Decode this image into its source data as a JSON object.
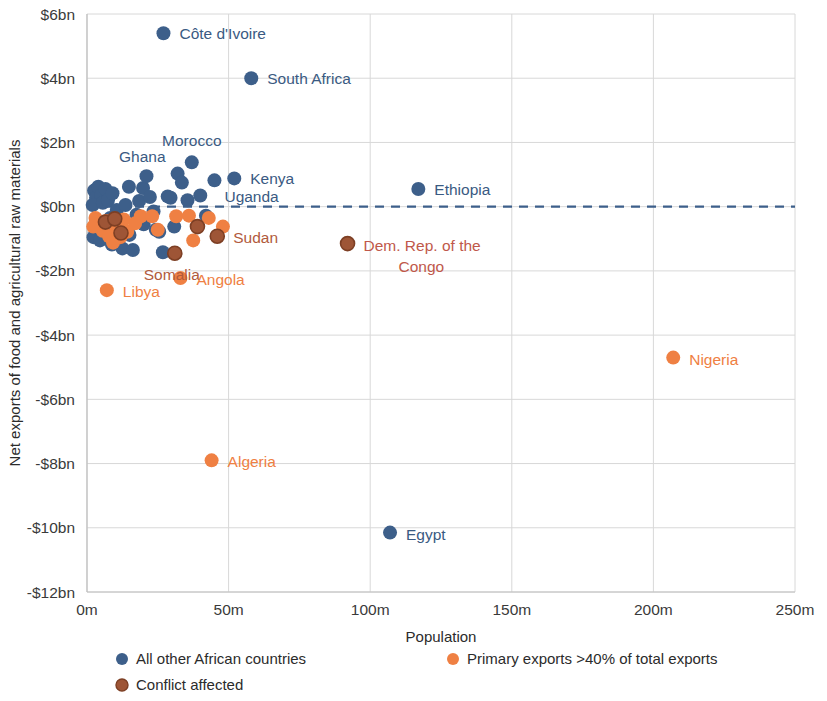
{
  "chart_data": {
    "type": "scatter",
    "title": "",
    "xlabel": "Population",
    "ylabel": "Net exports of food and agricultural raw materials",
    "xlim": [
      0,
      250
    ],
    "ylim": [
      -12,
      6
    ],
    "x_unit": "m",
    "y_unit": "bn",
    "x_ticks": [
      0,
      50,
      100,
      150,
      200,
      250
    ],
    "x_tick_labels": [
      "0m",
      "50m",
      "100m",
      "150m",
      "200m",
      "250m"
    ],
    "y_ticks": [
      6,
      4,
      2,
      0,
      -2,
      -4,
      -6,
      -8,
      -10,
      -12
    ],
    "y_tick_labels": [
      "$6bn",
      "$4bn",
      "$2bn",
      "$0bn",
      "-$2bn",
      "-$4bn",
      "-$6bn",
      "-$8bn",
      "-$10bn",
      "-$12bn"
    ],
    "grid": true,
    "zero_line": {
      "y": 0,
      "style": "dashed",
      "color": "#3d5f8a"
    },
    "legend_position": "bottom",
    "series": [
      {
        "name": "All other African countries",
        "key": "other",
        "color": "#3d5f8a",
        "points": [
          {
            "label": "Côte d'Ivoire",
            "x": 27.0,
            "y": 5.4,
            "label_pos": "right"
          },
          {
            "label": "South Africa",
            "x": 58.0,
            "y": 4.0,
            "label_pos": "right"
          },
          {
            "label": "Morocco",
            "x": 37.0,
            "y": 1.38,
            "label_pos": "above"
          },
          {
            "label": "Ghana",
            "x": 32.0,
            "y": 1.03,
            "label_pos": "above-left"
          },
          {
            "label": "Kenya",
            "x": 52.0,
            "y": 0.88,
            "label_pos": "right"
          },
          {
            "label": "Uganda",
            "x": 45.0,
            "y": 0.82,
            "label_pos": "below-right"
          },
          {
            "label": "Ethiopia",
            "x": 117.0,
            "y": 0.55,
            "label_pos": "right"
          },
          {
            "label": "Egypt",
            "x": 107.0,
            "y": -10.15,
            "label_pos": "right"
          },
          {
            "label": "",
            "x": 2.5,
            "y": 0.5
          },
          {
            "label": "",
            "x": 3.2,
            "y": 0.28
          },
          {
            "label": "",
            "x": 4.0,
            "y": 0.62
          },
          {
            "label": "",
            "x": 5.0,
            "y": 0.34
          },
          {
            "label": "",
            "x": 2.0,
            "y": 0.05
          },
          {
            "label": "",
            "x": 5.6,
            "y": 0.12
          },
          {
            "label": "",
            "x": 6.5,
            "y": 0.55
          },
          {
            "label": "",
            "x": 7.4,
            "y": 0.2
          },
          {
            "label": "",
            "x": 8.2,
            "y": -0.35
          },
          {
            "label": "",
            "x": 3.0,
            "y": -0.6
          },
          {
            "label": "",
            "x": 2.3,
            "y": -0.95
          },
          {
            "label": "",
            "x": 9.0,
            "y": 0.42
          },
          {
            "label": "",
            "x": 10.5,
            "y": -0.1
          },
          {
            "label": "",
            "x": 11.6,
            "y": -0.52
          },
          {
            "label": "",
            "x": 12.5,
            "y": -1.3
          },
          {
            "label": "",
            "x": 13.6,
            "y": 0.05
          },
          {
            "label": "",
            "x": 14.8,
            "y": 0.62
          },
          {
            "label": "",
            "x": 16.2,
            "y": -1.35
          },
          {
            "label": "",
            "x": 17.5,
            "y": -0.25
          },
          {
            "label": "",
            "x": 18.4,
            "y": 0.18
          },
          {
            "label": "",
            "x": 19.8,
            "y": 0.58
          },
          {
            "label": "",
            "x": 21.0,
            "y": 0.95
          },
          {
            "label": "",
            "x": 22.2,
            "y": 0.3
          },
          {
            "label": "",
            "x": 23.5,
            "y": -0.15
          },
          {
            "label": "",
            "x": 24.3,
            "y": -0.72
          },
          {
            "label": "",
            "x": 25.5,
            "y": -0.78
          },
          {
            "label": "",
            "x": 26.8,
            "y": -1.42
          },
          {
            "label": "",
            "x": 28.5,
            "y": 0.32
          },
          {
            "label": "",
            "x": 29.5,
            "y": 0.28
          },
          {
            "label": "",
            "x": 30.8,
            "y": -0.62
          },
          {
            "label": "",
            "x": 33.5,
            "y": 0.75
          },
          {
            "label": "",
            "x": 35.5,
            "y": 0.2
          },
          {
            "label": "",
            "x": 40.0,
            "y": 0.35
          },
          {
            "label": "",
            "x": 42.0,
            "y": -0.28
          },
          {
            "label": "",
            "x": 20.0,
            "y": -0.55
          },
          {
            "label": "",
            "x": 15.0,
            "y": -0.88
          },
          {
            "label": "",
            "x": 6.0,
            "y": -0.7
          },
          {
            "label": "",
            "x": 4.6,
            "y": -1.05
          },
          {
            "label": "",
            "x": 8.8,
            "y": -1.18
          }
        ]
      },
      {
        "name": "Primary exports >40% of total exports",
        "key": "primary",
        "color": "#ef8043",
        "points": [
          {
            "label": "Nigeria",
            "x": 207.0,
            "y": -4.7,
            "label_pos": "right"
          },
          {
            "label": "Algeria",
            "x": 44.0,
            "y": -7.9,
            "label_pos": "right"
          },
          {
            "label": "Angola",
            "x": 33.0,
            "y": -2.22,
            "label_pos": "right"
          },
          {
            "label": "Libya",
            "x": 7.0,
            "y": -2.6,
            "label_pos": "right"
          },
          {
            "label": "",
            "x": 3.0,
            "y": -0.35
          },
          {
            "label": "",
            "x": 4.2,
            "y": -0.55
          },
          {
            "label": "",
            "x": 5.5,
            "y": -0.75
          },
          {
            "label": "",
            "x": 6.8,
            "y": -0.45
          },
          {
            "label": "",
            "x": 7.8,
            "y": -0.92
          },
          {
            "label": "",
            "x": 9.2,
            "y": -1.12
          },
          {
            "label": "",
            "x": 10.4,
            "y": -0.68
          },
          {
            "label": "",
            "x": 11.8,
            "y": -0.95
          },
          {
            "label": "",
            "x": 13.0,
            "y": -0.4
          },
          {
            "label": "",
            "x": 14.2,
            "y": -0.78
          },
          {
            "label": "",
            "x": 2.2,
            "y": -0.62
          },
          {
            "label": "",
            "x": 17.0,
            "y": -0.52
          },
          {
            "label": "",
            "x": 19.0,
            "y": -0.3
          },
          {
            "label": "",
            "x": 23.0,
            "y": -0.3
          },
          {
            "label": "",
            "x": 25.0,
            "y": -0.72
          },
          {
            "label": "",
            "x": 31.5,
            "y": -0.3
          },
          {
            "label": "",
            "x": 36.0,
            "y": -0.28
          },
          {
            "label": "",
            "x": 37.5,
            "y": -1.05
          },
          {
            "label": "",
            "x": 43.0,
            "y": -0.35
          },
          {
            "label": "",
            "x": 48.0,
            "y": -0.62
          }
        ]
      },
      {
        "name": "Conflict affected",
        "key": "conflict",
        "color": "#9e5536",
        "points": [
          {
            "label": "Sudan",
            "x": 46.0,
            "y": -0.92,
            "label_pos": "right"
          },
          {
            "label": "Somalia",
            "x": 31.0,
            "y": -1.45,
            "label_pos": "below-right"
          },
          {
            "label": "Dem. Rep. of the Congo",
            "x": 92.0,
            "y": -1.15,
            "label_pos": "right-two-line"
          },
          {
            "label": "",
            "x": 6.5,
            "y": -0.48
          },
          {
            "label": "",
            "x": 12.0,
            "y": -0.82
          },
          {
            "label": "",
            "x": 39.0,
            "y": -0.62
          },
          {
            "label": "",
            "x": 9.8,
            "y": -0.38
          }
        ]
      }
    ],
    "annotations": [
      {
        "text": "Côte d'Ivoire",
        "x": 27.0,
        "y": 5.4
      },
      {
        "text": "South Africa",
        "x": 58.0,
        "y": 4.0
      },
      {
        "text": "Morocco",
        "x": 37.0,
        "y": 1.38
      },
      {
        "text": "Ghana",
        "x": 32.0,
        "y": 1.03
      },
      {
        "text": "Kenya",
        "x": 52.0,
        "y": 0.88
      },
      {
        "text": "Uganda",
        "x": 45.0,
        "y": 0.82
      },
      {
        "text": "Ethiopia",
        "x": 117.0,
        "y": 0.55
      },
      {
        "text": "Sudan",
        "x": 46.0,
        "y": -0.92
      },
      {
        "text": "Somalia",
        "x": 31.0,
        "y": -1.45
      },
      {
        "text": "Dem. Rep. of the Congo",
        "x": 92.0,
        "y": -1.15
      },
      {
        "text": "Angola",
        "x": 33.0,
        "y": -2.22
      },
      {
        "text": "Libya",
        "x": 7.0,
        "y": -2.6
      },
      {
        "text": "Nigeria",
        "x": 207.0,
        "y": -4.7
      },
      {
        "text": "Algeria",
        "x": 44.0,
        "y": -7.9
      },
      {
        "text": "Egypt",
        "x": 107.0,
        "y": -10.15
      }
    ]
  },
  "axes": {
    "x_title": "Population",
    "y_title": "Net exports of food and agricultural raw materials"
  },
  "legend": {
    "items": [
      {
        "label": "All other African countries",
        "color": "#3d5f8a"
      },
      {
        "label": "Primary exports >40% of total exports",
        "color": "#ef8043"
      },
      {
        "label": "Conflict affected",
        "color": "#9e5536"
      }
    ]
  }
}
